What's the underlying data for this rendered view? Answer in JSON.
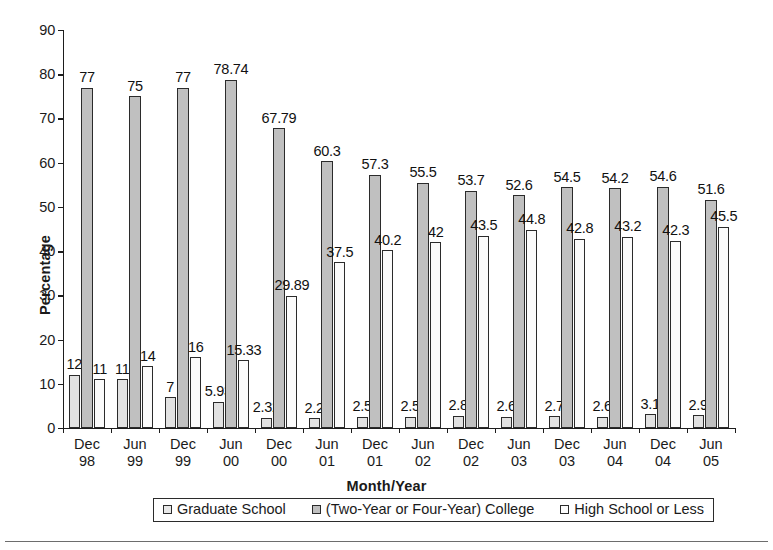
{
  "chart_data": {
    "type": "bar",
    "title": "",
    "xlabel": "Month/Year",
    "ylabel": "Percentage",
    "ylim": [
      0,
      90
    ],
    "ytick_step": 10,
    "yticks": [
      0,
      10,
      20,
      30,
      40,
      50,
      60,
      70,
      80,
      90
    ],
    "grid": false,
    "legend_position": "bottom",
    "categories": [
      "Dec 98",
      "Jun 99",
      "Dec 99",
      "Jun 00",
      "Dec 00",
      "Jun 01",
      "Dec 01",
      "Jun 02",
      "Dec 02",
      "Jun 03",
      "Dec 03",
      "Jun 04",
      "Dec 04",
      "Jun 05"
    ],
    "category_lines": [
      [
        "Dec",
        "98"
      ],
      [
        "Jun",
        "99"
      ],
      [
        "Dec",
        "99"
      ],
      [
        "Jun",
        "00"
      ],
      [
        "Dec",
        "00"
      ],
      [
        "Jun",
        "01"
      ],
      [
        "Dec",
        "01"
      ],
      [
        "Jun",
        "02"
      ],
      [
        "Dec",
        "02"
      ],
      [
        "Jun",
        "03"
      ],
      [
        "Dec",
        "03"
      ],
      [
        "Jun",
        "04"
      ],
      [
        "Dec",
        "04"
      ],
      [
        "Jun",
        "05"
      ]
    ],
    "series": [
      {
        "name": "Graduate School",
        "color": "#e2e2e2",
        "values": [
          12,
          11,
          7,
          5.93,
          2.32,
          2.2,
          2.5,
          2.5,
          2.8,
          2.6,
          2.7,
          2.6,
          3.1,
          2.9
        ],
        "labels": [
          "12",
          "11",
          "7",
          "5.93",
          "2.32",
          "2.2",
          "2.5",
          "2.5",
          "2.8",
          "2.6",
          "2.7",
          "2.6",
          "3.1",
          "2.9"
        ]
      },
      {
        "name": "(Two-Year or Four-Year) College",
        "color": "#c0c0c0",
        "values": [
          77,
          75,
          77,
          78.74,
          67.79,
          60.3,
          57.3,
          55.5,
          53.7,
          52.6,
          54.5,
          54.2,
          54.6,
          51.6
        ],
        "labels": [
          "77",
          "75",
          "77",
          "78.74",
          "67.79",
          "60.3",
          "57.3",
          "55.5",
          "53.7",
          "52.6",
          "54.5",
          "54.2",
          "54.6",
          "51.6"
        ]
      },
      {
        "name": "High School or Less",
        "color": "#fbfbfb",
        "values": [
          11,
          14,
          16,
          15.33,
          29.89,
          37.5,
          40.2,
          42,
          43.5,
          44.8,
          42.8,
          43.2,
          42.3,
          45.5
        ],
        "labels": [
          "11",
          "14",
          "16",
          "15.33",
          "29.89",
          "37.5",
          "40.2",
          "42",
          "43.5",
          "44.8",
          "42.8",
          "43.2",
          "42.3",
          "45.5"
        ]
      }
    ]
  },
  "legend": {
    "items": [
      {
        "label": "Graduate School",
        "swatch": "s0"
      },
      {
        "label": "(Two-Year or Four-Year) College",
        "swatch": "s1"
      },
      {
        "label": "High School or Less",
        "swatch": "s2"
      }
    ]
  }
}
